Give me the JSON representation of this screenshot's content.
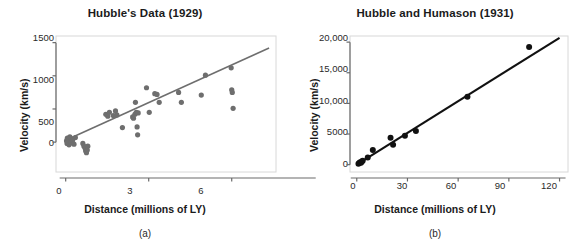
{
  "figure": {
    "background": "#ffffff"
  },
  "panels": [
    {
      "caption": "(a)",
      "title": "Hubble's Data (1929)",
      "marker_color": "#6e6e6e",
      "line_color": "#6e6e6e",
      "axis_color": "#6a6a6a",
      "chart_data": {
        "type": "scatter",
        "title": "Hubble's Data (1929)",
        "xlabel": "Distance (millions of LY)",
        "ylabel": "Velocity (km/s)",
        "xlim": [
          -0.35,
          7.6
        ],
        "ylim": [
          -450,
          1600
        ],
        "xticks": [
          0,
          3,
          6
        ],
        "xticklabels": [
          "0",
          "3",
          "6"
        ],
        "yticks": [
          0,
          500,
          1000,
          1500
        ],
        "yticklabels": [
          "0",
          "500",
          "1000",
          "1500"
        ],
        "grid": false,
        "legend": null,
        "points": [
          [
            0.03,
            20
          ],
          [
            0.05,
            -20
          ],
          [
            0.06,
            60
          ],
          [
            0.08,
            0
          ],
          [
            0.1,
            40
          ],
          [
            0.12,
            -40
          ],
          [
            0.15,
            80
          ],
          [
            0.18,
            10
          ],
          [
            0.2,
            -10
          ],
          [
            0.22,
            50
          ],
          [
            0.25,
            30
          ],
          [
            0.3,
            -30
          ],
          [
            0.35,
            70
          ],
          [
            0.62,
            -20
          ],
          [
            0.66,
            -60
          ],
          [
            0.7,
            -90
          ],
          [
            0.72,
            -130
          ],
          [
            0.75,
            -160
          ],
          [
            0.78,
            -120
          ],
          [
            0.8,
            -60
          ],
          [
            1.45,
            420
          ],
          [
            1.52,
            390
          ],
          [
            1.58,
            450
          ],
          [
            1.72,
            400
          ],
          [
            1.8,
            470
          ],
          [
            1.85,
            410
          ],
          [
            2.05,
            220
          ],
          [
            2.42,
            380
          ],
          [
            2.45,
            360
          ],
          [
            2.5,
            420
          ],
          [
            2.52,
            600
          ],
          [
            2.55,
            450
          ],
          [
            2.58,
            230
          ],
          [
            2.6,
            110
          ],
          [
            2.62,
            440
          ],
          [
            2.92,
            820
          ],
          [
            3.02,
            450
          ],
          [
            3.22,
            730
          ],
          [
            3.3,
            720
          ],
          [
            3.38,
            600
          ],
          [
            4.08,
            750
          ],
          [
            4.18,
            600
          ],
          [
            4.9,
            710
          ],
          [
            5.05,
            1010
          ],
          [
            5.98,
            1120
          ],
          [
            6.0,
            790
          ],
          [
            6.02,
            750
          ],
          [
            6.05,
            510
          ]
        ],
        "trendline": {
          "x0": 0.0,
          "y0": 30,
          "x1": 7.35,
          "y1": 1420,
          "slope": 189,
          "intercept": 30
        }
      }
    },
    {
      "caption": "(b)",
      "title": "Hubble and Humason (1931)",
      "marker_color": "#111111",
      "line_color": "#111111",
      "axis_color": "#6a6a6a",
      "chart_data": {
        "type": "scatter",
        "title": "Hubble and Humason (1931)",
        "xlabel": "Distance (millions of LY)",
        "ylabel": "Velocity (km/s)",
        "xlim": [
          -4,
          125
        ],
        "ylim": [
          -1200,
          21000
        ],
        "xticks": [
          0,
          30,
          60,
          90,
          120
        ],
        "xticklabels": [
          "0",
          "30",
          "60",
          "90",
          "120"
        ],
        "yticks": [
          0,
          5000,
          10000,
          15000,
          20000
        ],
        "yticklabels": [
          "0",
          "5000",
          "10,000",
          "15,000",
          "20,000"
        ],
        "grid": false,
        "legend": null,
        "points": [
          [
            1.0,
            150
          ],
          [
            1.5,
            250
          ],
          [
            2.0,
            400
          ],
          [
            2.5,
            300
          ],
          [
            3.0,
            500
          ],
          [
            3.5,
            620
          ],
          [
            6.5,
            1150
          ],
          [
            9.5,
            2400
          ],
          [
            20.0,
            4400
          ],
          [
            21.5,
            3250
          ],
          [
            28.5,
            4700
          ],
          [
            35.0,
            5500
          ],
          [
            65.5,
            11100
          ],
          [
            102.0,
            19200
          ]
        ],
        "trendline": {
          "x0": 0.0,
          "y0": 0,
          "x1": 120.0,
          "y1": 20700,
          "slope": 172.5,
          "intercept": 0
        }
      }
    }
  ]
}
